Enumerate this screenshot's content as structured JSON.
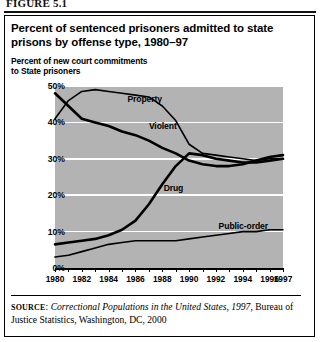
{
  "figure": {
    "label": "FIGURE 5.1"
  },
  "title": "Percent of sentenced prisoners admitted to state prisons by offense type, 1980–97",
  "axis_note_line1": "Percent of new court commitments",
  "axis_note_line2": "to State prisoners",
  "source": {
    "prefix": "SOURCE",
    "colon": ": ",
    "publication": "Correctional Populations in the United States, 1997",
    "rest": ", Bureau of Justice Statistics, Washington, DC, 2000"
  },
  "chart_data": {
    "type": "line",
    "title": "Percent of sentenced prisoners admitted to state prisons by offense type, 1980–97",
    "xlabel": "",
    "ylabel": "Percent of new court commitments to State prisoners",
    "xlim": [
      1980,
      1997
    ],
    "ylim": [
      0,
      50
    ],
    "grid": true,
    "legend": "inline-labels",
    "ytick_labels": [
      "0%",
      "10%",
      "20%",
      "30%",
      "40%",
      "50%"
    ],
    "ytick_values": [
      0,
      10,
      20,
      30,
      40,
      50
    ],
    "xtick_values": [
      1980,
      1981,
      1982,
      1983,
      1984,
      1985,
      1986,
      1987,
      1988,
      1989,
      1990,
      1991,
      1992,
      1993,
      1994,
      1995,
      1996,
      1997
    ],
    "xtick_labels": [
      "1980",
      "",
      "1982",
      "",
      "1984",
      "",
      "1986",
      "",
      "1988",
      "",
      "1990",
      "",
      "1992",
      "",
      "1994",
      "",
      "1996",
      "1997"
    ],
    "x": [
      1980,
      1981,
      1982,
      1983,
      1984,
      1985,
      1986,
      1987,
      1988,
      1989,
      1990,
      1991,
      1992,
      1993,
      1994,
      1995,
      1996,
      1997
    ],
    "series": [
      {
        "name": "Property",
        "label": "Property",
        "color": "#000000",
        "width": 1.6,
        "values": [
          41.0,
          46.0,
          48.5,
          49.0,
          48.5,
          48.0,
          47.5,
          47.0,
          44.5,
          40.5,
          34.0,
          31.5,
          31.0,
          30.5,
          30.0,
          29.5,
          30.0,
          30.0
        ]
      },
      {
        "name": "Violent",
        "label": "Violent",
        "color": "#000000",
        "width": 2.6,
        "values": [
          48.0,
          44.5,
          41.0,
          40.0,
          39.0,
          37.5,
          36.5,
          35.0,
          33.0,
          31.5,
          29.5,
          28.5,
          28.0,
          28.0,
          28.5,
          29.5,
          30.5,
          31.0
        ]
      },
      {
        "name": "Drug",
        "label": "Drug",
        "color": "#000000",
        "width": 2.6,
        "values": [
          6.5,
          7.0,
          7.5,
          8.0,
          9.0,
          10.5,
          13.0,
          17.5,
          23.0,
          28.0,
          31.5,
          31.0,
          30.0,
          29.5,
          29.0,
          29.0,
          29.5,
          30.0
        ]
      },
      {
        "name": "Public-order",
        "label": "Public-order",
        "color": "#000000",
        "width": 1.6,
        "values": [
          3.0,
          3.5,
          4.5,
          5.5,
          6.5,
          7.0,
          7.5,
          7.5,
          7.5,
          7.5,
          8.0,
          8.5,
          9.0,
          9.5,
          10.0,
          10.0,
          10.5,
          10.5
        ]
      }
    ],
    "series_label_positions": [
      {
        "name": "Property",
        "x": 1985.4,
        "y": 46.5
      },
      {
        "name": "Violent",
        "x": 1987.0,
        "y": 39.0
      },
      {
        "name": "Drug",
        "x": 1988.1,
        "y": 22.0
      },
      {
        "name": "Public-order",
        "x": 1992.2,
        "y": 11.6
      }
    ]
  }
}
